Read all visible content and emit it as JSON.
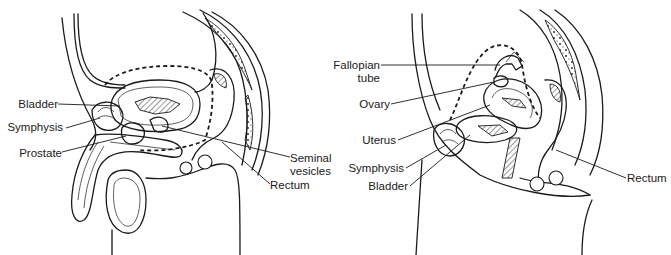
{
  "figure": {
    "panels": [
      {
        "name": "male-pelvis",
        "labels": [
          {
            "id": "bladder",
            "text": "Bladder"
          },
          {
            "id": "symphysis",
            "text": "Symphysis"
          },
          {
            "id": "prostate",
            "text": "Prostate"
          },
          {
            "id": "seminal_vesicles_1",
            "text": "Seminal"
          },
          {
            "id": "seminal_vesicles_2",
            "text": "vesicles"
          },
          {
            "id": "rectum",
            "text": "Rectum"
          }
        ]
      },
      {
        "name": "female-pelvis",
        "labels": [
          {
            "id": "fallopian_tube_1",
            "text": "Fallopian"
          },
          {
            "id": "fallopian_tube_2",
            "text": "tube"
          },
          {
            "id": "ovary",
            "text": "Ovary"
          },
          {
            "id": "uterus",
            "text": "Uterus"
          },
          {
            "id": "symphysis",
            "text": "Symphysis"
          },
          {
            "id": "bladder",
            "text": "Bladder"
          },
          {
            "id": "rectum",
            "text": "Rectum"
          }
        ]
      }
    ],
    "colors": {
      "line": "#1a1a1a",
      "background": "#ffffff"
    }
  }
}
